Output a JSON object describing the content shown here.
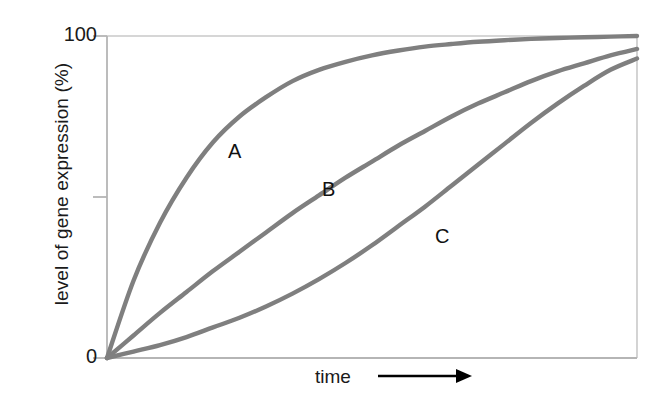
{
  "chart_data": {
    "type": "line",
    "title": "",
    "subtitle": "",
    "xlabel": "time",
    "ylabel": "level of gene expression (%)",
    "xlabel_arrow": "right-arrow",
    "x": [
      0,
      0.05,
      0.1,
      0.15,
      0.2,
      0.25,
      0.3,
      0.35,
      0.4,
      0.45,
      0.5,
      0.55,
      0.6,
      0.65,
      0.7,
      0.75,
      0.8,
      0.85,
      0.9,
      0.95,
      1.0
    ],
    "xlim": [
      0,
      1
    ],
    "ylim": [
      0,
      100
    ],
    "x_tick_labels": [],
    "y_tick_labels": [
      "0",
      "100"
    ],
    "y_ticks": [
      0,
      50,
      100
    ],
    "y_tick_unlabeled": [
      50
    ],
    "grid": false,
    "legend": "none",
    "series": [
      {
        "name": "A",
        "label": "A",
        "description": "fast saturating curve, reaches plateau earliest",
        "values": [
          0,
          24,
          42,
          56,
          67,
          75,
          81,
          86,
          89.5,
          92,
          94,
          95.5,
          96.7,
          97.5,
          98.2,
          98.7,
          99.1,
          99.4,
          99.6,
          99.8,
          100
        ]
      },
      {
        "name": "B",
        "label": "B",
        "description": "intermediate, nearly linear rise then gentle plateau",
        "values": [
          0,
          7,
          14,
          20.5,
          27,
          33,
          39,
          45,
          50.5,
          56,
          61,
          66,
          70.5,
          75,
          79,
          82.5,
          86,
          89,
          91.5,
          94,
          96
        ]
      },
      {
        "name": "C",
        "label": "C",
        "description": "slow start, sigmoidal, latest to rise",
        "values": [
          0,
          2,
          4,
          6.5,
          9.5,
          12.5,
          16,
          20,
          24.5,
          29.5,
          35,
          41,
          47,
          53.5,
          60,
          66.5,
          73,
          79,
          84.5,
          89.5,
          93
        ]
      }
    ],
    "colors": {
      "curve": "#7f7f7f",
      "axis": "#b8b8b8",
      "frame": "#c8c8c8",
      "text": "#1a1a1a",
      "arrow": "#000000",
      "background": "#ffffff"
    }
  },
  "axes": {
    "y_title": "level of gene expression (%)",
    "y_max_label": "100",
    "y_min_label": "0",
    "x_title": "time"
  },
  "curve_labels": {
    "a": "A",
    "b": "B",
    "c": "C"
  }
}
